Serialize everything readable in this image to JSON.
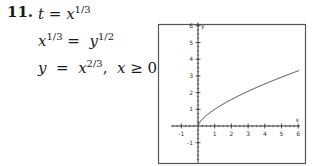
{
  "problem": {
    "number": "11.",
    "lines": [
      {
        "lhs": "t",
        "eq": " = ",
        "base": "x",
        "exp": "1/3",
        "rest": ""
      },
      {
        "lhs": "x",
        "lhs_exp": "1/3",
        "eq": " =  ",
        "base": "y",
        "exp": "1/2"
      },
      {
        "lhs": "y",
        "eq": "  =  ",
        "base": "x",
        "exp": "2/3",
        "rest1": ",  ",
        "cond_var": "x",
        "cond_op": " ≥ ",
        "cond_val": "0"
      }
    ]
  },
  "chart_data": {
    "type": "line",
    "title": "",
    "function": "y = x^(2/3), x >= 0",
    "xlabel": "x",
    "ylabel": "y",
    "xlim": [
      -1.6,
      6.1
    ],
    "ylim": [
      -2.2,
      6.2
    ],
    "x_ticks": [
      "-1",
      "1",
      "2",
      "3",
      "4",
      "5",
      "6"
    ],
    "y_ticks": [
      "-1",
      "1",
      "2",
      "3",
      "4",
      "5",
      "6"
    ],
    "grid": false,
    "x": [
      0,
      0.25,
      0.5,
      1,
      2,
      3,
      4,
      5,
      6
    ],
    "y": [
      0,
      0.397,
      0.63,
      1.0,
      1.587,
      2.08,
      2.52,
      2.924,
      3.302
    ]
  },
  "colors": {
    "ink": "#1a1a1a",
    "frame": "#555555",
    "background": "#ffffff"
  }
}
